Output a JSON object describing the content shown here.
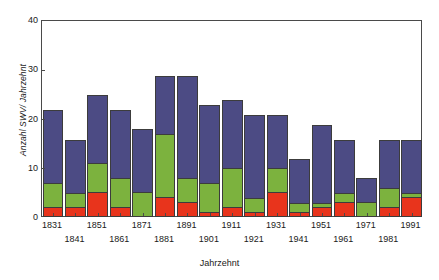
{
  "chart_data": {
    "type": "bar",
    "title": "",
    "subtitle": "",
    "xlabel": "Jahrzehnt",
    "ylabel": "Anzahl SWV/ Jahrzehnt",
    "stacked": true,
    "grid": false,
    "legend": "none",
    "ylim": [
      0,
      40
    ],
    "yticks": [
      0,
      10,
      20,
      30,
      40
    ],
    "ytick_labels": [
      "0",
      "10",
      "20",
      "30",
      "40"
    ],
    "categories": [
      "1831",
      "1841",
      "1851",
      "1861",
      "1871",
      "1881",
      "1891",
      "1901",
      "1911",
      "1921",
      "1931",
      "1941",
      "1951",
      "1961",
      "1971",
      "1981",
      "1991"
    ],
    "series": [
      {
        "name": "series-red",
        "color": "#e8341c",
        "values": [
          2,
          2,
          5,
          2,
          0,
          4,
          3,
          1,
          2,
          1,
          5,
          1,
          2,
          3,
          0,
          2,
          4
        ]
      },
      {
        "name": "series-green",
        "color": "#7cb23e",
        "values": [
          5,
          3,
          6,
          6,
          5,
          13,
          5,
          6,
          8,
          3,
          5,
          2,
          1,
          2,
          3,
          4,
          1
        ]
      },
      {
        "name": "series-blue",
        "color": "#4c4b84",
        "values": [
          15,
          11,
          14,
          14,
          13,
          12,
          21,
          16,
          14,
          17,
          11,
          9,
          16,
          11,
          5,
          10,
          11
        ]
      }
    ],
    "totals": [
      22,
      16,
      25,
      22,
      18,
      29,
      29,
      23,
      24,
      21,
      21,
      12,
      19,
      16,
      8,
      16,
      16
    ]
  }
}
